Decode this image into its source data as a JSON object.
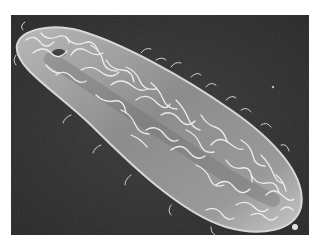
{
  "image": {
    "subject": "Scanning electron micrograph of a ciliated protozoan cell covered in cilia",
    "background_color": "#2e2e2e",
    "cell_color": "#8a8a8a",
    "cilia_color": "#e6e6e6",
    "page_background": "#ffffff"
  }
}
